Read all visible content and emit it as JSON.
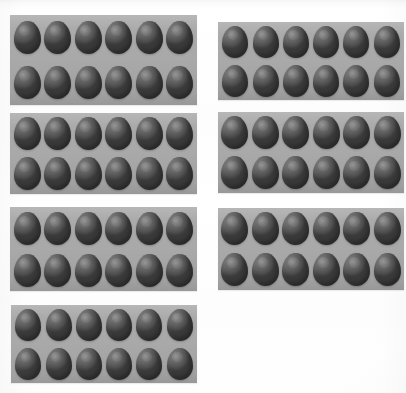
{
  "scene": {
    "title": "Egg cartons illustration",
    "width": 406,
    "height": 393,
    "background_color": "#fefefe",
    "carton_color": "#a9a9a9",
    "egg_color": "#5f5f5f",
    "total_cartons": 7,
    "eggs_per_carton": 12,
    "total_eggs": 84,
    "grid_layout": "2 columns x 4 rows, last cell empty"
  },
  "cartons": [
    {
      "id": "carton-1",
      "label": "Egg carton 1",
      "position": "top-left",
      "x": 10,
      "y": 15,
      "width": 187,
      "height": 90,
      "columns": 6,
      "rows": 2,
      "egg_count": 12
    },
    {
      "id": "carton-2",
      "label": "Egg carton 2",
      "position": "top-right",
      "x": 218,
      "y": 22,
      "width": 186,
      "height": 78,
      "columns": 6,
      "rows": 2,
      "egg_count": 12
    },
    {
      "id": "carton-3",
      "label": "Egg carton 3",
      "position": "second-row-left",
      "x": 10,
      "y": 113,
      "width": 187,
      "height": 81,
      "columns": 6,
      "rows": 2,
      "egg_count": 12
    },
    {
      "id": "carton-4",
      "label": "Egg carton 4",
      "position": "second-row-right",
      "x": 218,
      "y": 112,
      "width": 186,
      "height": 81,
      "columns": 6,
      "rows": 2,
      "egg_count": 12
    },
    {
      "id": "carton-5",
      "label": "Egg carton 5",
      "position": "third-row-left",
      "x": 10,
      "y": 207,
      "width": 187,
      "height": 84,
      "columns": 6,
      "rows": 2,
      "egg_count": 12
    },
    {
      "id": "carton-6",
      "label": "Egg carton 6",
      "position": "third-row-right",
      "x": 218,
      "y": 208,
      "width": 186,
      "height": 82,
      "columns": 6,
      "rows": 2,
      "egg_count": 12
    },
    {
      "id": "carton-7",
      "label": "Egg carton 7",
      "position": "bottom-left",
      "x": 11,
      "y": 305,
      "width": 186,
      "height": 78,
      "columns": 6,
      "rows": 2,
      "egg_count": 12
    }
  ]
}
